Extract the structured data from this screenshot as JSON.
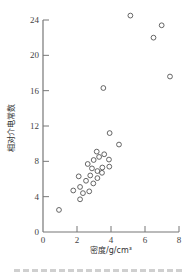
{
  "chart_data": {
    "type": "scatter",
    "title": "",
    "xlabel": "密度/g/cm³",
    "ylabel": "相对介电常数",
    "xlim": [
      0,
      8
    ],
    "ylim": [
      0,
      24
    ],
    "xticks": [
      0,
      2,
      4,
      6,
      8
    ],
    "yticks": [
      0,
      4,
      8,
      12,
      16,
      20,
      24
    ],
    "grid": false,
    "legend": null,
    "marker": "open-circle",
    "series": [
      {
        "name": "samples",
        "points": [
          [
            0.94,
            2.5
          ],
          [
            1.78,
            4.7
          ],
          [
            2.18,
            3.7
          ],
          [
            2.18,
            5.1
          ],
          [
            2.1,
            6.3
          ],
          [
            2.35,
            4.4
          ],
          [
            2.53,
            5.8
          ],
          [
            2.72,
            4.6
          ],
          [
            2.63,
            7.7
          ],
          [
            2.78,
            6.4
          ],
          [
            2.88,
            7.2
          ],
          [
            2.96,
            5.5
          ],
          [
            2.98,
            8.15
          ],
          [
            3.16,
            9.1
          ],
          [
            3.2,
            6.9
          ],
          [
            3.2,
            6.1
          ],
          [
            3.3,
            8.5
          ],
          [
            3.47,
            6.7
          ],
          [
            3.49,
            7.3
          ],
          [
            3.6,
            8.8
          ],
          [
            3.88,
            8.2
          ],
          [
            3.9,
            7.4
          ],
          [
            3.92,
            11.2
          ],
          [
            4.47,
            9.9
          ],
          [
            3.55,
            16.3
          ],
          [
            5.14,
            24.5
          ],
          [
            6.5,
            22.0
          ],
          [
            6.98,
            23.4
          ],
          [
            7.47,
            17.6
          ]
        ]
      }
    ]
  },
  "axes": {
    "x_title": "密度/g/cm³",
    "y_title": "相对介电常数"
  }
}
